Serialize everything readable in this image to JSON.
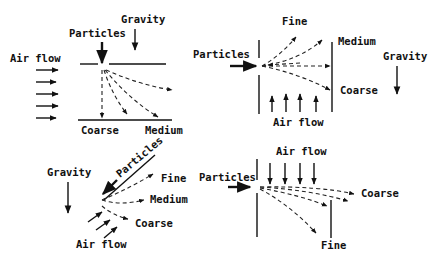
{
  "figure": {
    "panels": [
      {
        "id": "top-left",
        "labels": {
          "gravity": "Gravity",
          "particles": "Particles",
          "air_flow": "Air flow",
          "coarse": "Coarse",
          "medium": "Medium"
        }
      },
      {
        "id": "top-right",
        "labels": {
          "fine": "Fine",
          "particles": "Particles",
          "medium": "Medium",
          "gravity": "Gravity",
          "coarse": "Coarse",
          "air_flow": "Air flow"
        }
      },
      {
        "id": "bottom-left",
        "labels": {
          "gravity": "Gravity",
          "particles": "Particles",
          "fine": "Fine",
          "medium": "Medium",
          "coarse": "Coarse",
          "air_flow": "Air flow"
        }
      },
      {
        "id": "bottom-right",
        "labels": {
          "air_flow": "Air flow",
          "particles": "Particles",
          "coarse": "Coarse",
          "fine": "Fine"
        }
      }
    ]
  },
  "colors": {
    "ink": "#111111",
    "background": "#ffffff"
  }
}
